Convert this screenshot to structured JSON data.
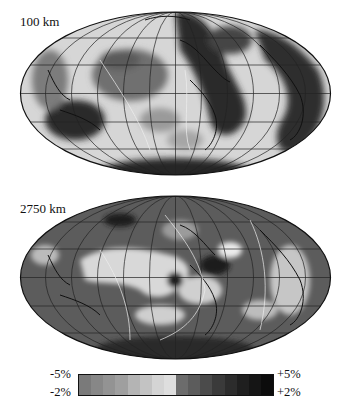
{
  "figure": {
    "panels": [
      {
        "depth_label": "100 km",
        "projection": "Mollweide/Hammer world map"
      },
      {
        "depth_label": "2750 km",
        "projection": "Mollweide/Hammer world map"
      }
    ],
    "colorbar": {
      "top_left": "-5%",
      "bottom_left": "-2%",
      "top_right": "+5%",
      "bottom_right": "+2%",
      "segments": [
        "#7a7a7a",
        "#878787",
        "#939393",
        "#9f9f9f",
        "#b4b4b4",
        "#c3c3c3",
        "#d4d4d4",
        "#dedede",
        "#6c6c6c",
        "#5c5c5c",
        "#4b4b4b",
        "#3a3a3a",
        "#2c2c2c",
        "#1f1f1f",
        "#151515",
        "#0c0c0c"
      ]
    },
    "colors": {
      "land_outline": "#111111",
      "plate_boundary": "#e8e8e8",
      "grid": "#222222"
    }
  }
}
